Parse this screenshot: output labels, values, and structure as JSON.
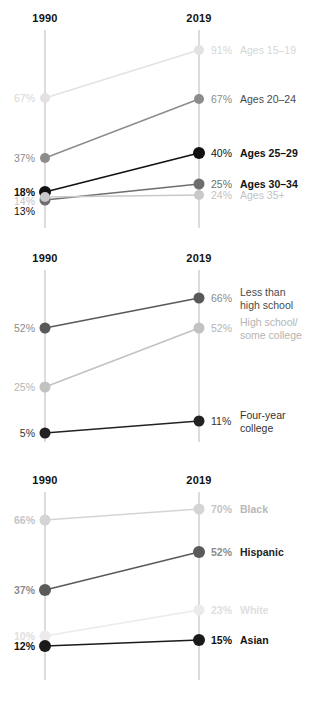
{
  "layout": {
    "axis_left_x": 45,
    "axis_right_x": 199,
    "axis_color": "#dcdcdc"
  },
  "charts": [
    {
      "id": "chart-1",
      "top": 0,
      "height": 240,
      "axis_top": 30,
      "axis_bottom": 228,
      "header": {
        "left": "1990",
        "right": "2019"
      },
      "series": [
        {
          "name": "Ages 15-19",
          "label": "Ages 15–19",
          "left_value": "67%",
          "right_value": "91%",
          "left_y": 98,
          "right_y": 50,
          "color": "#e2e2e2",
          "label_color": "#d6d6d6",
          "value_color": "#d6d6d6",
          "bold": false,
          "line_width": 1.4,
          "dot_r": 5
        },
        {
          "name": "Ages 20-24",
          "label": "Ages 20–24",
          "left_value": "37%",
          "right_value": "67%",
          "left_y": 158,
          "right_y": 99,
          "color": "#8c8c8c",
          "label_color": "#4a4a4a",
          "value_color": "#8c8c8c",
          "bold": false,
          "line_width": 1.4,
          "dot_r": 5
        },
        {
          "name": "Ages 25-29",
          "label": "Ages 25–29",
          "left_value": "18%",
          "right_value": "40%",
          "left_y": 192,
          "right_y": 153,
          "color": "#111111",
          "label_color": "#111111",
          "value_color": "#111111",
          "bold": true,
          "line_width": 1.6,
          "dot_r": 6
        },
        {
          "name": "Ages 30-34",
          "label": "Ages 30–34",
          "left_value": "13%",
          "right_value": "25%",
          "left_y": 200,
          "right_y": 184,
          "color": "#6e6e6e",
          "label_color": "#111111",
          "value_color": "#6e6e6e",
          "bold": true,
          "line_width": 1.5,
          "dot_r": 5.5
        },
        {
          "name": "Ages 35-plus",
          "label": "Ages 35+",
          "left_value": "14%",
          "right_value": "24%",
          "left_y": 197,
          "right_y": 195,
          "color": "#c9c9c9",
          "label_color": "#c2c2c2",
          "value_color": "#c2c2c2",
          "bold": false,
          "line_width": 1.3,
          "dot_r": 5
        }
      ],
      "left_value_overrides": [
        {
          "text": "18%",
          "y": 192,
          "color": "#111111",
          "bold": true
        },
        {
          "text": "14%",
          "y": 201,
          "color": "#c2c2c2",
          "bold": false
        },
        {
          "text": "13%",
          "y": 211,
          "color": "#111111",
          "bold": false
        }
      ],
      "right_value_overrides": [],
      "suppress_left_values": [
        "Ages 25-29",
        "Ages 30-34",
        "Ages 35-plus"
      ]
    },
    {
      "id": "chart-2",
      "top": 240,
      "height": 222,
      "axis_top": 30,
      "axis_bottom": 202,
      "header": {
        "left": "1990",
        "right": "2019"
      },
      "series": [
        {
          "name": "less-than-high-school",
          "label": "Less than\nhigh school",
          "left_value": "52%",
          "right_value": "66%",
          "left_y": 88,
          "right_y": 58,
          "color": "#595959",
          "label_color": "#4a4a4a",
          "value_color": "#8c8c8c",
          "bold": false,
          "line_width": 1.5,
          "dot_r": 5.5
        },
        {
          "name": "high-school-some-college",
          "label": "High school/\nsome college",
          "left_value": "25%",
          "right_value": "52%",
          "left_y": 147,
          "right_y": 88,
          "color": "#c2c2c2",
          "label_color": "#b4b4b4",
          "value_color": "#b4b4b4",
          "bold": false,
          "line_width": 1.5,
          "dot_r": 5.5
        },
        {
          "name": "four-year-college",
          "label": "Four-year\ncollege",
          "left_value": "5%",
          "right_value": "11%",
          "left_y": 193,
          "right_y": 181,
          "color": "#222222",
          "label_color": "#333333",
          "value_color": "#333333",
          "bold": false,
          "line_width": 1.6,
          "dot_r": 5.5
        }
      ],
      "left_value_overrides": [],
      "right_value_overrides": [],
      "suppress_left_values": []
    },
    {
      "id": "chart-3",
      "top": 462,
      "height": 240,
      "axis_top": 30,
      "axis_bottom": 218,
      "header": {
        "left": "1990",
        "right": "2019"
      },
      "series": [
        {
          "name": "Black",
          "label": "Black",
          "left_value": "66%",
          "right_value": "70%",
          "left_y": 58,
          "right_y": 47,
          "color": "#d4d4d4",
          "label_color": "#b8b8b8",
          "value_color": "#c4c4c4",
          "bold": true,
          "line_width": 1.4,
          "dot_r": 5.5
        },
        {
          "name": "Hispanic",
          "label": "Hispanic",
          "left_value": "37%",
          "right_value": "52%",
          "left_y": 128,
          "right_y": 90,
          "color": "#5a5a5a",
          "label_color": "#222222",
          "value_color": "#8c8c8c",
          "bold": true,
          "line_width": 1.6,
          "dot_r": 6
        },
        {
          "name": "White",
          "label": "White",
          "left_value": "10%",
          "right_value": "23%",
          "left_y": 174,
          "right_y": 148,
          "color": "#ebebeb",
          "label_color": "#e0e0e0",
          "value_color": "#e0e0e0",
          "bold": true,
          "line_width": 1.4,
          "dot_r": 5.5
        },
        {
          "name": "Asian",
          "label": "Asian",
          "left_value": "12%",
          "right_value": "15%",
          "left_y": 184,
          "right_y": 178,
          "color": "#1a1a1a",
          "label_color": "#111111",
          "value_color": "#111111",
          "bold": true,
          "line_width": 1.7,
          "dot_r": 6
        }
      ],
      "left_value_overrides": [],
      "right_value_overrides": [],
      "suppress_left_values": []
    }
  ],
  "chart_data": {
    "type": "line",
    "subtype": "slope-chart",
    "x": [
      "1990",
      "2019"
    ],
    "xlabel": "",
    "ylabel": "",
    "grid": false,
    "legend": "right-of-plot-inline",
    "panels": [
      {
        "title": "",
        "categories": [
          "1990",
          "2019"
        ],
        "series": [
          {
            "name": "Ages 15–19",
            "values": [
              67,
              91
            ]
          },
          {
            "name": "Ages 20–24",
            "values": [
              37,
              67
            ]
          },
          {
            "name": "Ages 25–29",
            "values": [
              18,
              40
            ]
          },
          {
            "name": "Ages 30–34",
            "values": [
              13,
              25
            ]
          },
          {
            "name": "Ages 35+",
            "values": [
              14,
              24
            ]
          }
        ]
      },
      {
        "title": "",
        "categories": [
          "1990",
          "2019"
        ],
        "series": [
          {
            "name": "Less than high school",
            "values": [
              52,
              66
            ]
          },
          {
            "name": "High school/some college",
            "values": [
              25,
              52
            ]
          },
          {
            "name": "Four-year college",
            "values": [
              5,
              11
            ]
          }
        ]
      },
      {
        "title": "",
        "categories": [
          "1990",
          "2019"
        ],
        "series": [
          {
            "name": "Black",
            "values": [
              66,
              70
            ]
          },
          {
            "name": "Hispanic",
            "values": [
              37,
              52
            ]
          },
          {
            "name": "White",
            "values": [
              10,
              23
            ]
          },
          {
            "name": "Asian",
            "values": [
              12,
              15
            ]
          }
        ]
      }
    ]
  }
}
